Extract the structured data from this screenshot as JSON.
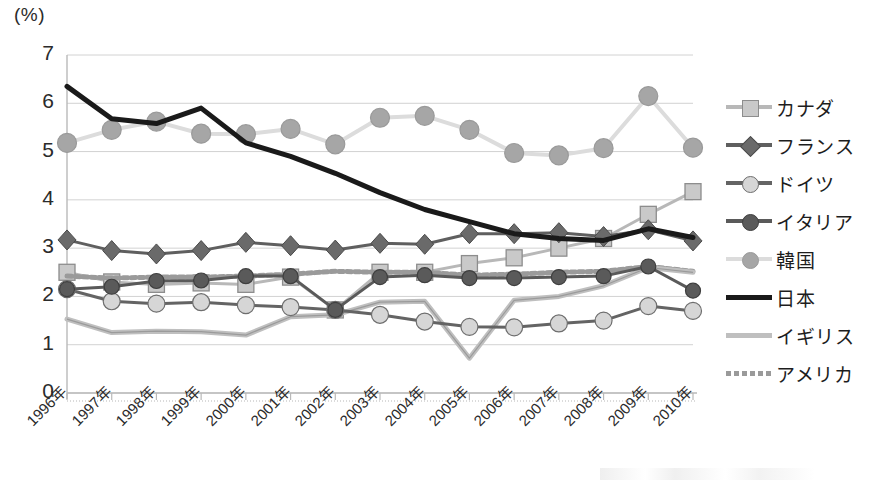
{
  "chart_data": {
    "type": "line",
    "title": "",
    "subtitle": "",
    "xlabel": "",
    "ylabel": "(%)",
    "unit_label": "(%)",
    "ylim": [
      0,
      7
    ],
    "ytick_values": [
      0,
      1,
      2,
      3,
      4,
      5,
      6,
      7
    ],
    "ytick_labels": [
      "0",
      "1",
      "2",
      "3",
      "4",
      "5",
      "6",
      "7"
    ],
    "grid": true,
    "legend_position": "right",
    "categories": [
      "1996年",
      "1997年",
      "1998年",
      "1999年",
      "2000年",
      "2001年",
      "2002年",
      "2003年",
      "2004年",
      "2005年",
      "2006年",
      "2007年",
      "2008年",
      "2009年",
      "2010年"
    ],
    "x": [
      1996,
      1997,
      1998,
      1999,
      2000,
      2001,
      2002,
      2003,
      2004,
      2005,
      2006,
      2007,
      2008,
      2009,
      2010
    ],
    "series": [
      {
        "name": "カナダ",
        "key": "canada",
        "color": "#b8b8b8",
        "marker": "square",
        "marker_fill": "#c9c9c9",
        "marker_edge": "#8d8d8d",
        "line_width": 3,
        "dash": "solid",
        "values": [
          2.5,
          2.3,
          2.25,
          2.28,
          2.25,
          2.4,
          1.72,
          2.5,
          2.5,
          2.68,
          2.8,
          3.0,
          3.2,
          3.7,
          4.17
        ]
      },
      {
        "name": "フランス",
        "key": "france",
        "color": "#5f5f5f",
        "marker": "diamond",
        "marker_fill": "#6a6a6a",
        "marker_edge": "#4a4a4a",
        "line_width": 3,
        "dash": "solid",
        "values": [
          3.17,
          2.95,
          2.88,
          2.95,
          3.12,
          3.05,
          2.96,
          3.1,
          3.08,
          3.3,
          3.3,
          3.32,
          3.24,
          3.38,
          3.15
        ]
      },
      {
        "name": "ドイツ",
        "key": "germany",
        "color": "#646464",
        "marker": "circle",
        "marker_fill": "#d6d6d6",
        "marker_edge": "#6e6e6e",
        "line_width": 3,
        "dash": "solid",
        "values": [
          2.15,
          1.9,
          1.85,
          1.88,
          1.82,
          1.78,
          1.72,
          1.62,
          1.48,
          1.37,
          1.36,
          1.44,
          1.5,
          1.8,
          1.7
        ]
      },
      {
        "name": "イタリア",
        "key": "italy",
        "color": "#5a5a5a",
        "marker": "circle",
        "marker_fill": "#5a5a5a",
        "marker_edge": "#3f3f3f",
        "line_width": 3,
        "dash": "solid",
        "values": [
          2.15,
          2.2,
          2.32,
          2.33,
          2.42,
          2.42,
          1.72,
          2.4,
          2.44,
          2.38,
          2.38,
          2.4,
          2.42,
          2.62,
          2.12
        ]
      },
      {
        "name": "韓国",
        "key": "korea",
        "color": "#dcdcdc",
        "marker": "circle",
        "marker_fill": "#a6a6a6",
        "marker_edge": "#9a9a9a",
        "line_width": 4,
        "dash": "solid",
        "values": [
          5.18,
          5.45,
          5.62,
          5.37,
          5.36,
          5.47,
          5.15,
          5.7,
          5.74,
          5.45,
          4.97,
          4.92,
          5.07,
          6.15,
          5.08
        ]
      },
      {
        "name": "日本",
        "key": "japan",
        "color": "#1a1a1a",
        "marker": "none",
        "marker_fill": "#1a1a1a",
        "marker_edge": "#1a1a1a",
        "line_width": 5,
        "dash": "solid",
        "values": [
          6.35,
          5.68,
          5.58,
          5.9,
          5.18,
          4.9,
          4.55,
          4.15,
          3.8,
          3.55,
          3.3,
          3.2,
          3.16,
          3.4,
          3.22
        ]
      },
      {
        "name": "イギリス",
        "key": "uk",
        "color": "#bfbfbf",
        "marker": "none",
        "marker_fill": "#bfbfbf",
        "marker_edge": "#9e9e9e",
        "line_width": 5,
        "dash": "solid",
        "values": [
          1.53,
          1.25,
          1.28,
          1.27,
          1.2,
          1.58,
          1.62,
          1.88,
          1.9,
          0.72,
          1.92,
          2.0,
          2.22,
          2.6,
          2.5
        ]
      },
      {
        "name": "アメリカ",
        "key": "usa",
        "color": "#9a9a9a",
        "marker": "none",
        "marker_fill": "#9a9a9a",
        "marker_edge": "#7d7d7d",
        "line_width": 5,
        "dash": "dashed",
        "values": [
          2.42,
          2.38,
          2.4,
          2.4,
          2.42,
          2.46,
          2.52,
          2.5,
          2.5,
          2.44,
          2.46,
          2.5,
          2.52,
          2.62,
          2.52
        ]
      }
    ]
  },
  "legend": {
    "items": [
      {
        "label": "カナダ"
      },
      {
        "label": "フランス"
      },
      {
        "label": "ドイツ"
      },
      {
        "label": "イタリア"
      },
      {
        "label": "韓国"
      },
      {
        "label": "日本"
      },
      {
        "label": "イギリス"
      },
      {
        "label": "アメリカ"
      }
    ]
  }
}
